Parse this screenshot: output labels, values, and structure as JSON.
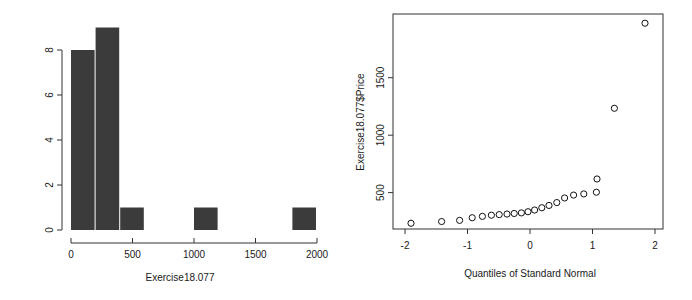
{
  "figure": {
    "background_color": "#ffffff",
    "panels": [
      "histogram",
      "qq-plot"
    ]
  },
  "chart_data": [
    {
      "type": "bar",
      "subtype": "histogram",
      "title": "",
      "xlabel": "Exercise18.077",
      "ylabel": "",
      "xlim": [
        0,
        2000
      ],
      "ylim": [
        0,
        9
      ],
      "grid": false,
      "legend": null,
      "bar_color": "#3b3b3b",
      "bin_width": 200,
      "x_ticks": [
        0,
        500,
        1000,
        1500,
        2000
      ],
      "x_tick_labels": [
        "0",
        "500",
        "1000",
        "1500",
        "2000"
      ],
      "y_ticks": [
        0,
        2,
        4,
        6,
        8
      ],
      "y_tick_labels": [
        "0",
        "2",
        "4",
        "6",
        "8"
      ],
      "bins": [
        {
          "start": 0,
          "end": 200,
          "count": 8
        },
        {
          "start": 200,
          "end": 400,
          "count": 9
        },
        {
          "start": 400,
          "end": 600,
          "count": 1
        },
        {
          "start": 600,
          "end": 800,
          "count": 0
        },
        {
          "start": 800,
          "end": 1000,
          "count": 0
        },
        {
          "start": 1000,
          "end": 1200,
          "count": 1
        },
        {
          "start": 1200,
          "end": 1400,
          "count": 0
        },
        {
          "start": 1400,
          "end": 1600,
          "count": 0
        },
        {
          "start": 1600,
          "end": 1800,
          "count": 0
        },
        {
          "start": 1800,
          "end": 2000,
          "count": 1
        }
      ],
      "categories": [
        "0-200",
        "200-400",
        "400-600",
        "600-800",
        "800-1000",
        "1000-1200",
        "1200-1400",
        "1400-1600",
        "1600-1800",
        "1800-2000"
      ],
      "values": [
        8,
        9,
        1,
        0,
        0,
        1,
        0,
        0,
        0,
        1
      ]
    },
    {
      "type": "scatter",
      "subtype": "normal-qq-plot",
      "title": "",
      "xlabel": "Quantiles of Standard Normal",
      "ylabel": "Exercise18.077$Price",
      "xlim": [
        -2.25,
        2.25
      ],
      "ylim": [
        60,
        1930
      ],
      "grid": false,
      "legend": null,
      "marker": "open-circle",
      "marker_color": "#111111",
      "x_ticks": [
        -2,
        -1,
        0,
        1,
        2
      ],
      "x_tick_labels": [
        "-2",
        "-1",
        "0",
        "1",
        "2"
      ],
      "y_ticks": [
        500,
        1000,
        1500
      ],
      "y_tick_labels": [
        "500",
        "1000",
        "1500"
      ],
      "points": [
        {
          "x": -1.95,
          "y": 110
        },
        {
          "x": -1.44,
          "y": 125
        },
        {
          "x": -1.14,
          "y": 135
        },
        {
          "x": -0.93,
          "y": 158
        },
        {
          "x": -0.76,
          "y": 170
        },
        {
          "x": -0.61,
          "y": 180
        },
        {
          "x": -0.48,
          "y": 185
        },
        {
          "x": -0.35,
          "y": 190
        },
        {
          "x": -0.23,
          "y": 195
        },
        {
          "x": -0.11,
          "y": 200
        },
        {
          "x": 0.0,
          "y": 210
        },
        {
          "x": 0.11,
          "y": 225
        },
        {
          "x": 0.23,
          "y": 245
        },
        {
          "x": 0.35,
          "y": 265
        },
        {
          "x": 0.48,
          "y": 290
        },
        {
          "x": 0.61,
          "y": 330
        },
        {
          "x": 0.76,
          "y": 355
        },
        {
          "x": 0.93,
          "y": 365
        },
        {
          "x": 1.14,
          "y": 380
        },
        {
          "x": 1.15,
          "y": 495
        },
        {
          "x": 1.44,
          "y": 1110
        },
        {
          "x": 1.95,
          "y": 1850
        }
      ],
      "n_points": 22
    }
  ]
}
